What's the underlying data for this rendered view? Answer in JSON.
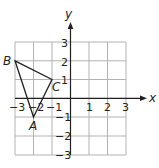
{
  "axes": {
    "x_label": "x",
    "y_label": "y",
    "x_range": [
      -3,
      3
    ],
    "y_range": [
      -3,
      3
    ],
    "x_ticks": [
      "−3",
      "−2",
      "−1",
      "1",
      "2",
      "3"
    ],
    "y_ticks": [
      "3",
      "2",
      "1",
      "−1",
      "−2",
      "−3"
    ]
  },
  "triangle": {
    "vertices": [
      {
        "name": "A",
        "x": -2,
        "y": -1
      },
      {
        "name": "B",
        "x": -3,
        "y": 2
      },
      {
        "name": "C",
        "x": -1,
        "y": 1
      }
    ]
  },
  "colors": {
    "grid": "#b3b3b3",
    "axis": "#231f20",
    "triangle": "#231f20"
  }
}
